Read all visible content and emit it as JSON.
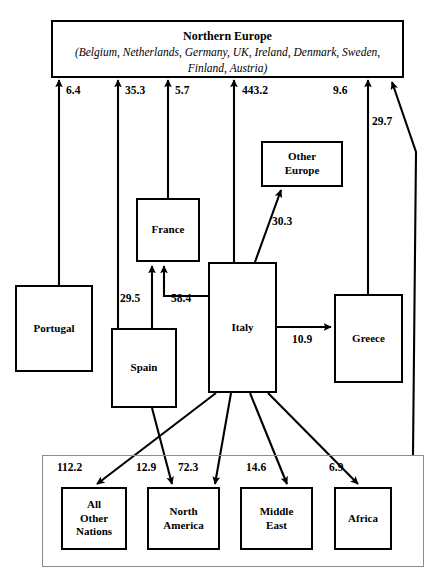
{
  "diagram": {
    "type": "flow-diagram",
    "colors": {
      "node_border": "#000000",
      "group_border": "#8d8d8d",
      "edge": "#000000",
      "background": "#ffffff"
    },
    "nodes": [
      {
        "id": "northern-europe",
        "title": "Northern Europe",
        "subtitle": "(Belgium, Netherlands, Germany, UK, Ireland, Denmark, Sweden, Finland, Austria)"
      },
      {
        "id": "other-europe",
        "label": "Other\nEurope"
      },
      {
        "id": "france",
        "label": "France"
      },
      {
        "id": "portugal",
        "label": "Portugal"
      },
      {
        "id": "spain",
        "label": "Spain"
      },
      {
        "id": "italy",
        "label": "Italy"
      },
      {
        "id": "greece",
        "label": "Greece"
      },
      {
        "id": "all-other-nations",
        "label": "All\nOther\nNations"
      },
      {
        "id": "north-america",
        "label": "North\nAmerica"
      },
      {
        "id": "middle-east",
        "label": "Middle\nEast"
      },
      {
        "id": "africa",
        "label": "Africa"
      }
    ],
    "edges": [
      {
        "id": "portugal-to-northern-europe",
        "from": "portugal",
        "to": "northern-europe",
        "value": "6.4"
      },
      {
        "id": "spain-to-northern-europe",
        "from": "spain",
        "to": "northern-europe",
        "value": "35.3"
      },
      {
        "id": "france-to-northern-europe",
        "from": "france",
        "to": "northern-europe",
        "value": "5.7"
      },
      {
        "id": "italy-to-northern-europe",
        "from": "italy",
        "to": "northern-europe",
        "value": "443.2"
      },
      {
        "id": "greece-to-northern-europe",
        "from": "greece",
        "to": "northern-europe",
        "value": "9.6"
      },
      {
        "id": "bottom-group-to-northern-europe",
        "from": "all-other-nations-group",
        "to": "northern-europe",
        "value": "29.7"
      },
      {
        "id": "italy-to-other-europe",
        "from": "italy",
        "to": "other-europe",
        "value": "30.3"
      },
      {
        "id": "spain-to-france",
        "from": "spain",
        "to": "france",
        "value": "29.5"
      },
      {
        "id": "italy-to-france",
        "from": "italy",
        "to": "france",
        "value": "58.4"
      },
      {
        "id": "italy-to-greece",
        "from": "italy",
        "to": "greece",
        "value": "10.9"
      },
      {
        "id": "italy-to-all-other-nations",
        "from": "italy",
        "to": "all-other-nations",
        "value": "112.2"
      },
      {
        "id": "spain-to-north-america",
        "from": "spain",
        "to": "north-america",
        "value": "12.9"
      },
      {
        "id": "italy-to-north-america",
        "from": "italy",
        "to": "north-america",
        "value": "72.3"
      },
      {
        "id": "italy-to-middle-east",
        "from": "italy",
        "to": "middle-east",
        "value": "14.6"
      },
      {
        "id": "italy-to-africa",
        "from": "italy",
        "to": "africa",
        "value": "6.9"
      }
    ]
  }
}
